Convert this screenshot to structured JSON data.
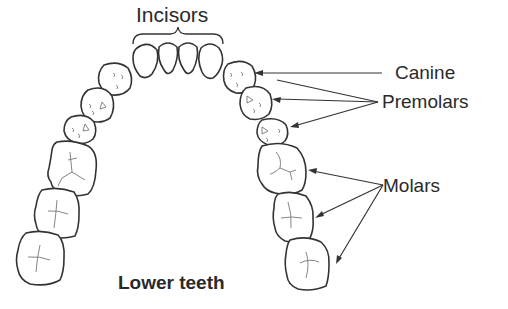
{
  "diagram": {
    "title": "Lower teeth",
    "labels": {
      "incisors": "Incisors",
      "canine": "Canine",
      "premolars": "Premolars",
      "molars": "Molars",
      "caption": "Lower teeth"
    },
    "tooth_groups": [
      {
        "name": "Incisors",
        "count": 4,
        "pointer": "brace"
      },
      {
        "name": "Canine",
        "count_per_side": 1,
        "pointer_side": "right",
        "arrows": 1
      },
      {
        "name": "Premolars",
        "count_per_side": 2,
        "pointer_side": "right",
        "arrows": 2
      },
      {
        "name": "Molars",
        "count_per_side": 3,
        "pointer_side": "right",
        "arrows": 3
      }
    ],
    "colors": {
      "outline": "#333333",
      "text": "#2a2a2a",
      "background": "#ffffff"
    }
  }
}
